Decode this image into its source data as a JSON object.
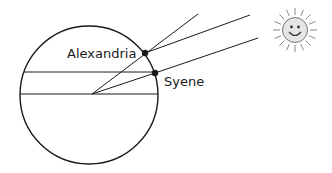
{
  "diagram": {
    "labels": {
      "alexandria": "Alexandria",
      "syene": "Syene"
    },
    "colors": {
      "stroke": "#1a1a1a",
      "sun_fill": "#e6e6e6",
      "sun_stroke": "#888888",
      "background": "#ffffff"
    },
    "elements": {
      "earth": "circle",
      "sun": "smiling-sun-icon",
      "points": [
        "Alexandria",
        "Syene"
      ]
    }
  }
}
